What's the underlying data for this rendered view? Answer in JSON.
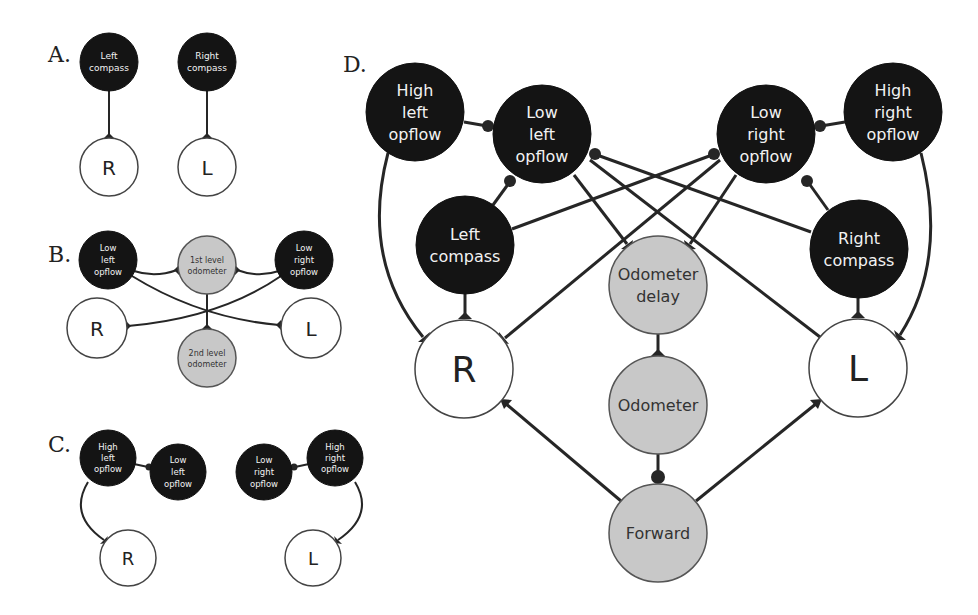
{
  "figure": {
    "panels": [
      {
        "label": "A.",
        "nodes": [
          {
            "id": "A_lc",
            "lines": [
              "Left",
              "compass"
            ],
            "type": "dark"
          },
          {
            "id": "A_rc",
            "lines": [
              "Right",
              "compass"
            ],
            "type": "dark"
          },
          {
            "id": "A_R",
            "lines": [
              "R"
            ],
            "type": "white"
          },
          {
            "id": "A_L",
            "lines": [
              "L"
            ],
            "type": "white"
          }
        ],
        "edges": [
          {
            "from": "Left compass",
            "to": "R",
            "kind": "excitatory"
          },
          {
            "from": "Right compass",
            "to": "L",
            "kind": "excitatory"
          }
        ]
      },
      {
        "label": "B.",
        "nodes": [
          {
            "id": "B_llo",
            "lines": [
              "Low",
              "left",
              "opflow"
            ],
            "type": "dark"
          },
          {
            "id": "B_o1",
            "lines": [
              "1st level",
              "odometer"
            ],
            "type": "gray"
          },
          {
            "id": "B_lro",
            "lines": [
              "Low",
              "right",
              "opflow"
            ],
            "type": "dark"
          },
          {
            "id": "B_R",
            "lines": [
              "R"
            ],
            "type": "white"
          },
          {
            "id": "B_o2",
            "lines": [
              "2nd level",
              "odometer"
            ],
            "type": "gray"
          },
          {
            "id": "B_L",
            "lines": [
              "L"
            ],
            "type": "white"
          }
        ],
        "edges": [
          {
            "from": "Low left opflow",
            "to": "1st level odometer",
            "kind": "excitatory"
          },
          {
            "from": "Low right opflow",
            "to": "1st level odometer",
            "kind": "excitatory"
          },
          {
            "from": "Low left opflow",
            "to": "L",
            "kind": "excitatory"
          },
          {
            "from": "Low right opflow",
            "to": "R",
            "kind": "excitatory"
          },
          {
            "from": "1st level odometer",
            "to": "2nd level odometer",
            "kind": "excitatory"
          }
        ]
      },
      {
        "label": "C.",
        "nodes": [
          {
            "id": "C_hlo",
            "lines": [
              "High",
              "left",
              "opflow"
            ],
            "type": "dark"
          },
          {
            "id": "C_llo",
            "lines": [
              "Low",
              "left",
              "opflow"
            ],
            "type": "dark"
          },
          {
            "id": "C_lro",
            "lines": [
              "Low",
              "right",
              "opflow"
            ],
            "type": "dark"
          },
          {
            "id": "C_hro",
            "lines": [
              "High",
              "right",
              "opflow"
            ],
            "type": "dark"
          },
          {
            "id": "C_R",
            "lines": [
              "R"
            ],
            "type": "white"
          },
          {
            "id": "C_L",
            "lines": [
              "L"
            ],
            "type": "white"
          }
        ],
        "edges": [
          {
            "from": "High left opflow",
            "to": "Low left opflow",
            "kind": "inhibitory"
          },
          {
            "from": "High right opflow",
            "to": "Low right opflow",
            "kind": "inhibitory"
          },
          {
            "from": "High left opflow",
            "to": "R",
            "kind": "excitatory"
          },
          {
            "from": "High right opflow",
            "to": "L",
            "kind": "excitatory"
          }
        ]
      },
      {
        "label": "D.",
        "nodes": [
          {
            "id": "D_hlo",
            "lines": [
              "High",
              "left",
              "opflow"
            ],
            "type": "dark"
          },
          {
            "id": "D_llo",
            "lines": [
              "Low",
              "left",
              "opflow"
            ],
            "type": "dark"
          },
          {
            "id": "D_lro",
            "lines": [
              "Low",
              "right",
              "opflow"
            ],
            "type": "dark"
          },
          {
            "id": "D_hro",
            "lines": [
              "High",
              "right",
              "opflow"
            ],
            "type": "dark"
          },
          {
            "id": "D_lc",
            "lines": [
              "Left",
              "compass"
            ],
            "type": "dark"
          },
          {
            "id": "D_rc",
            "lines": [
              "Right",
              "compass"
            ],
            "type": "dark"
          },
          {
            "id": "D_od",
            "lines": [
              "Odometer",
              "delay"
            ],
            "type": "gray"
          },
          {
            "id": "D_R",
            "lines": [
              "R"
            ],
            "type": "white"
          },
          {
            "id": "D_L",
            "lines": [
              "L"
            ],
            "type": "white"
          },
          {
            "id": "D_o",
            "lines": [
              "Odometer"
            ],
            "type": "gray"
          },
          {
            "id": "D_f",
            "lines": [
              "Forward"
            ],
            "type": "gray"
          }
        ],
        "edges": [
          {
            "from": "High left opflow",
            "to": "Low left opflow",
            "kind": "inhibitory"
          },
          {
            "from": "High right opflow",
            "to": "Low right opflow",
            "kind": "inhibitory"
          },
          {
            "from": "Left compass",
            "to": "Low left opflow",
            "kind": "inhibitory"
          },
          {
            "from": "Right compass",
            "to": "Low right opflow",
            "kind": "inhibitory"
          },
          {
            "from": "Left compass",
            "to": "Low right opflow",
            "kind": "inhibitory"
          },
          {
            "from": "Right compass",
            "to": "Low left opflow",
            "kind": "inhibitory"
          },
          {
            "from": "High left opflow",
            "to": "R",
            "kind": "excitatory"
          },
          {
            "from": "High right opflow",
            "to": "L",
            "kind": "excitatory"
          },
          {
            "from": "Left compass",
            "to": "R",
            "kind": "excitatory"
          },
          {
            "from": "Right compass",
            "to": "L",
            "kind": "excitatory"
          },
          {
            "from": "Low left opflow",
            "to": "Odometer delay",
            "kind": "excitatory"
          },
          {
            "from": "Low right opflow",
            "to": "Odometer delay",
            "kind": "excitatory"
          },
          {
            "from": "Low left opflow",
            "to": "L",
            "kind": "excitatory"
          },
          {
            "from": "Low right opflow",
            "to": "R",
            "kind": "excitatory"
          },
          {
            "from": "Odometer delay",
            "to": "Odometer",
            "kind": "excitatory"
          },
          {
            "from": "Odometer",
            "to": "Forward",
            "kind": "inhibitory"
          },
          {
            "from": "Forward",
            "to": "R",
            "kind": "excitatory"
          },
          {
            "from": "Forward",
            "to": "L",
            "kind": "excitatory"
          }
        ]
      }
    ]
  },
  "labels": {
    "A": "A.",
    "B": "B.",
    "C": "C.",
    "D": "D.",
    "a_lc_1": "Left",
    "a_lc_2": "compass",
    "a_rc_1": "Right",
    "a_rc_2": "compass",
    "a_R": "R",
    "a_L": "L",
    "b_llo_1": "Low",
    "b_llo_2": "left",
    "b_llo_3": "opflow",
    "b_o1_1": "1st level",
    "b_o1_2": "odometer",
    "b_lro_1": "Low",
    "b_lro_2": "right",
    "b_lro_3": "opflow",
    "b_R": "R",
    "b_L": "L",
    "b_o2_1": "2nd level",
    "b_o2_2": "odometer",
    "c_hlo_1": "High",
    "c_hlo_2": "left",
    "c_hlo_3": "opflow",
    "c_llo_1": "Low",
    "c_llo_2": "left",
    "c_llo_3": "opflow",
    "c_lro_1": "Low",
    "c_lro_2": "right",
    "c_lro_3": "opflow",
    "c_hro_1": "High",
    "c_hro_2": "right",
    "c_hro_3": "opflow",
    "c_R": "R",
    "c_L": "L",
    "d_hlo_1": "High",
    "d_hlo_2": "left",
    "d_hlo_3": "opflow",
    "d_llo_1": "Low",
    "d_llo_2": "left",
    "d_llo_3": "opflow",
    "d_lro_1": "Low",
    "d_lro_2": "right",
    "d_lro_3": "opflow",
    "d_hro_1": "High",
    "d_hro_2": "right",
    "d_hro_3": "opflow",
    "d_lc_1": "Left",
    "d_lc_2": "compass",
    "d_rc_1": "Right",
    "d_rc_2": "compass",
    "d_od_1": "Odometer",
    "d_od_2": "delay",
    "d_R": "R",
    "d_L": "L",
    "d_o": "Odometer",
    "d_f": "Forward"
  },
  "colors": {
    "dark_node": "#141414",
    "gray_node": "#c8c8c8",
    "white_node": "#ffffff",
    "edge": "#262626"
  }
}
